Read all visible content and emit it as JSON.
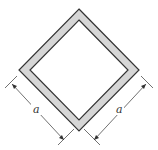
{
  "diagram": {
    "colors": {
      "background": "#ffffff",
      "wall_fill": "#d6d6d6",
      "stroke": "#333333"
    },
    "dimensions": [
      {
        "side": "left",
        "label": "a"
      },
      {
        "side": "right",
        "label": "a"
      }
    ]
  }
}
